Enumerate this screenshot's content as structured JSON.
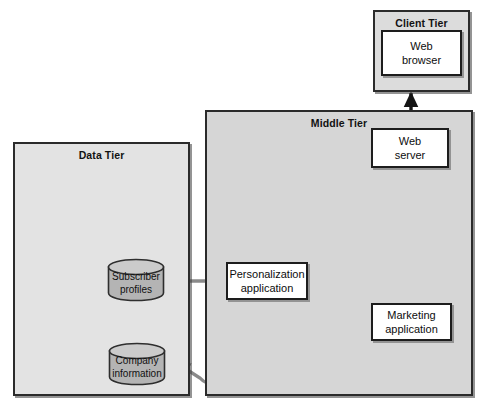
{
  "diagram": {
    "tiers": [
      {
        "id": "client",
        "label": "Client Tier"
      },
      {
        "id": "middle",
        "label": "Middle Tier"
      },
      {
        "id": "data",
        "label": "Data Tier"
      }
    ],
    "nodes": [
      {
        "id": "web-browser",
        "line1": "Web",
        "line2": "browser",
        "tier": "client",
        "shape": "rectangle"
      },
      {
        "id": "web-server",
        "line1": "Web",
        "line2": "server",
        "tier": "middle",
        "shape": "rectangle"
      },
      {
        "id": "personalization",
        "line1": "Personalization",
        "line2": "application",
        "tier": "middle",
        "shape": "rectangle"
      },
      {
        "id": "marketing",
        "line1": "Marketing",
        "line2": "application",
        "tier": "middle",
        "shape": "rectangle"
      },
      {
        "id": "subscriber-profiles",
        "line1": "Subscriber",
        "line2": "profiles",
        "tier": "data",
        "shape": "cylinder"
      },
      {
        "id": "company-information",
        "line1": "Company",
        "line2": "information",
        "tier": "data",
        "shape": "cylinder"
      }
    ],
    "connectors": [
      {
        "id": "browser-to-server",
        "from": "web-browser",
        "to": "web-server",
        "style": "straight-vertical",
        "heads": "both",
        "color": "#141414"
      },
      {
        "id": "server-to-marketing",
        "from": "web-server",
        "to": "marketing",
        "style": "straight-vertical",
        "heads": "both",
        "color": "#141414"
      },
      {
        "id": "server-to-personalization",
        "from": "web-server",
        "to": "personalization",
        "style": "curved",
        "heads": "both",
        "color": "#141414"
      },
      {
        "id": "subscriber-to-personalization",
        "from": "subscriber-profiles",
        "to": "personalization",
        "style": "straight-horizontal",
        "heads": "both",
        "color": "#8a8a8a"
      },
      {
        "id": "marketing-to-company",
        "from": "marketing",
        "to": "company-information",
        "style": "curved-loop",
        "heads": "single",
        "color": "#8a8a8a"
      }
    ],
    "colors": {
      "client_tier_fill": "#dcdcdc",
      "middle_tier_fill": "#d6d6d6",
      "data_tier_fill": "#e3e3e3",
      "node_fill": "#ffffff",
      "border": "#1d1d1d",
      "cylinder_fill": "#b4b4b4",
      "cylinder_top": "#c9c9c9",
      "arrow_black": "#141414",
      "arrow_gray": "#8a8a8a"
    }
  }
}
